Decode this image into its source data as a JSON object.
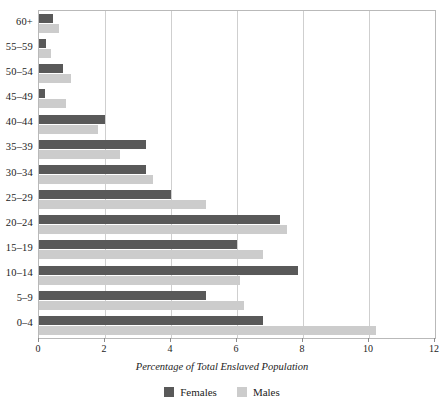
{
  "chart_data": {
    "type": "bar",
    "orientation": "horizontal",
    "title": "",
    "subtitle": "",
    "xlabel": "Percentage of Total Enslaved Population",
    "ylabel": "",
    "xlim": [
      0,
      12
    ],
    "xticks": [
      0,
      2,
      4,
      6,
      8,
      10,
      12
    ],
    "xtick_labels": [
      "0",
      "2",
      "4",
      "6",
      "8",
      "10",
      "12"
    ],
    "grid": "vertical",
    "legend_position": "bottom-center",
    "categories": [
      "0–4",
      "5–9",
      "10–14",
      "15–19",
      "20–24",
      "25–29",
      "30–34",
      "35–39",
      "40–44",
      "45–49",
      "50–54",
      "55–59",
      "60+"
    ],
    "series": [
      {
        "name": "Females",
        "color": "#595959",
        "values": [
          6.8,
          5.05,
          7.85,
          6.0,
          7.3,
          4.0,
          3.25,
          3.25,
          2.0,
          0.17,
          0.72,
          0.2,
          0.42
        ]
      },
      {
        "name": "Males",
        "color": "#cccccc",
        "values": [
          10.2,
          6.2,
          6.1,
          6.8,
          7.5,
          5.05,
          3.45,
          2.45,
          1.8,
          0.82,
          0.97,
          0.35,
          0.6
        ]
      }
    ],
    "legend": [
      "Females",
      "Males"
    ]
  },
  "axis": {
    "frame_color": "#b9b9b9",
    "gridline_color": "#cfcfcf",
    "tick_color": "#8c8c8c"
  }
}
